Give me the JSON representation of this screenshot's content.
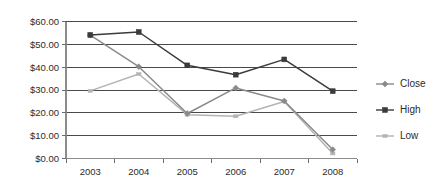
{
  "chart_data": {
    "type": "line",
    "title": "",
    "subtitle": "",
    "xlabel": "",
    "ylabel": "",
    "categories": [
      "2003",
      "2004",
      "2005",
      "2006",
      "2007",
      "2008"
    ],
    "series": [
      {
        "name": "Close",
        "color": "#8a8a8a",
        "marker": "diamond",
        "values": [
          54.0,
          40.2,
          19.7,
          30.9,
          25.2,
          3.9
        ]
      },
      {
        "name": "High",
        "color": "#3b3b3b",
        "marker": "square",
        "values": [
          54.1,
          55.4,
          40.8,
          36.7,
          43.4,
          29.5
        ]
      },
      {
        "name": "Low",
        "color": "#b4b4b4",
        "marker": "tick",
        "values": [
          29.6,
          37.0,
          19.2,
          18.5,
          25.0,
          2.2
        ]
      }
    ],
    "ylim": [
      0,
      60
    ],
    "ytick_values": [
      0,
      10,
      20,
      30,
      40,
      50,
      60
    ],
    "ytick_labels": [
      "$0.00",
      "$10.00",
      "$20.00",
      "$30.00",
      "$40.00",
      "$50.00",
      "$60.00"
    ],
    "xtick_labels": [
      "2003",
      "2004",
      "2005",
      "2006",
      "2007",
      "2008"
    ],
    "grid": {
      "horizontal": true,
      "vertical": false
    },
    "legend": {
      "position": "right",
      "entries": [
        {
          "label": "Close",
          "color": "#8a8a8a"
        },
        {
          "label": "High",
          "color": "#3b3b3b"
        },
        {
          "label": "Low",
          "color": "#b4b4b4"
        }
      ]
    },
    "axis_colors": {
      "gridline": "#4a4a4a",
      "axis": "#8c8c8c",
      "text": "#2b2b2b"
    }
  }
}
